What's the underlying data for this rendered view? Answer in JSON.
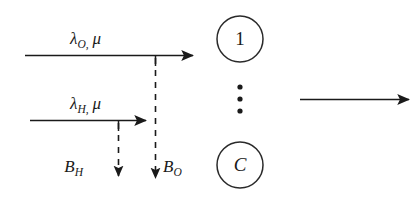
{
  "figure": {
    "stroke_color": "#1a1a1a",
    "background_color": "#ffffff",
    "arrivals": [
      {
        "id": "arrival-high-priority",
        "label_lambda": "λ",
        "label_subscript": "O",
        "label_comma": ",",
        "label_mu": "μ",
        "full_label": "λ_O, μ"
      },
      {
        "id": "arrival-low-priority",
        "label_lambda": "λ",
        "label_subscript": "H",
        "label_comma": ",",
        "label_mu": "μ",
        "full_label": "λ_H, μ"
      }
    ],
    "blocking": [
      {
        "id": "blocking-h",
        "label_base": "B",
        "label_subscript": "H",
        "full_label": "B_H"
      },
      {
        "id": "blocking-o",
        "label_base": "B",
        "label_subscript": "O",
        "full_label": "B_O"
      }
    ],
    "servers": {
      "first_label": "1",
      "last_label": "C",
      "ellipsis_dots": 3,
      "ellipsis_label": "vertical-ellipsis"
    },
    "departure": {
      "id": "departure-arrow",
      "label": ""
    }
  }
}
